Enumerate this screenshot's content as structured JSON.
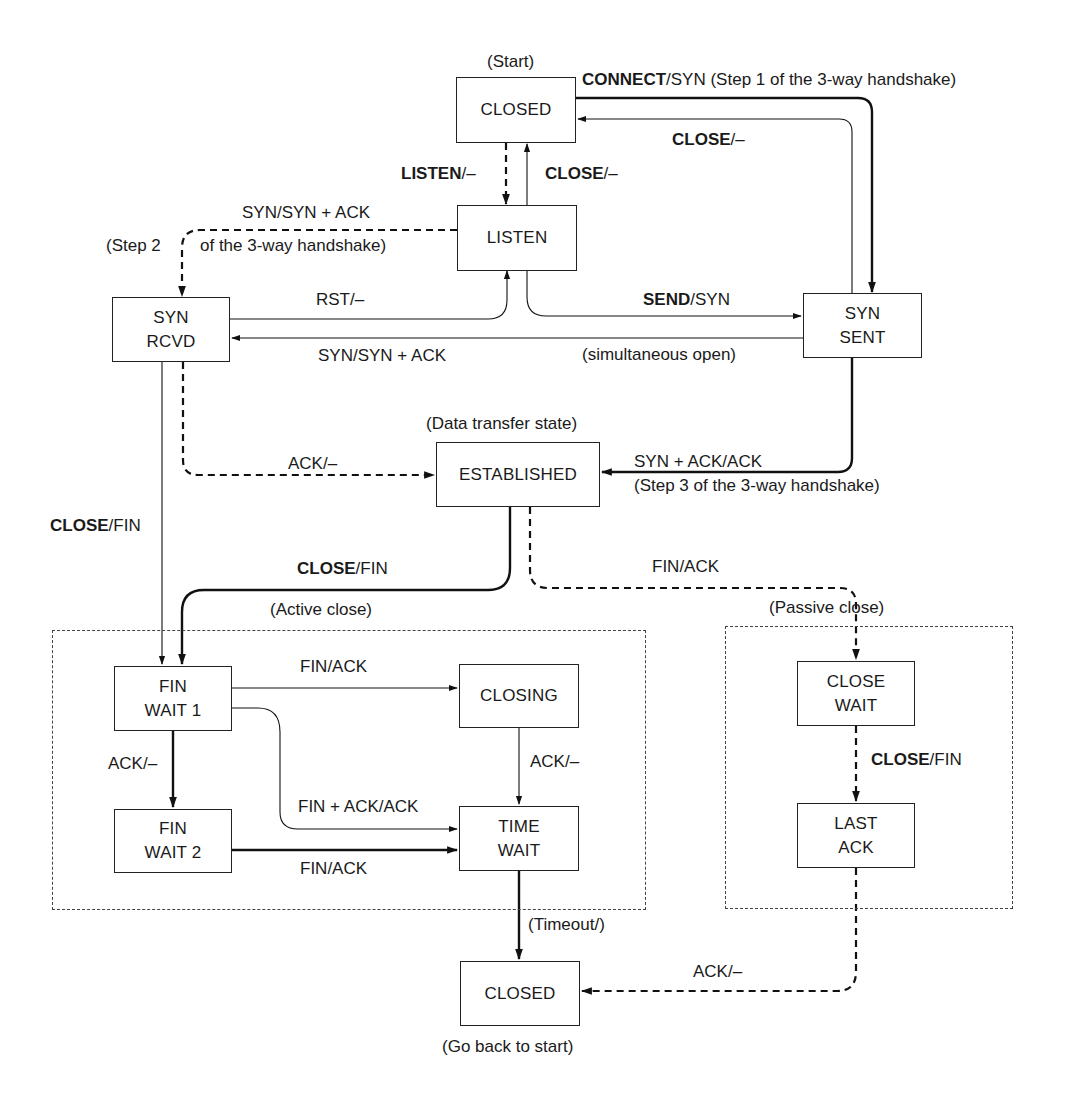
{
  "diagram": {
    "type": "state-machine",
    "states": {
      "closed_start": {
        "label": "CLOSED",
        "annotation": "(Start)"
      },
      "listen": {
        "label": "LISTEN"
      },
      "syn_rcvd": {
        "line1": "SYN",
        "line2": "RCVD"
      },
      "syn_sent": {
        "line1": "SYN",
        "line2": "SENT"
      },
      "established": {
        "label": "ESTABLISHED",
        "annotation": "(Data transfer state)"
      },
      "fin_wait_1": {
        "line1": "FIN",
        "line2": "WAIT 1"
      },
      "fin_wait_2": {
        "line1": "FIN",
        "line2": "WAIT 2"
      },
      "closing": {
        "label": "CLOSING"
      },
      "time_wait": {
        "line1": "TIME",
        "line2": "WAIT"
      },
      "close_wait": {
        "line1": "CLOSE",
        "line2": "WAIT"
      },
      "last_ack": {
        "line1": "LAST",
        "line2": "ACK"
      },
      "closed_end": {
        "label": "CLOSED",
        "annotation": "(Go back to start)"
      }
    },
    "groups": {
      "active_close": "(Active close)",
      "passive_close": "(Passive close)"
    },
    "transitions": {
      "connect": {
        "event": "CONNECT",
        "action": "/SYN (Step 1 of the 3-way handshake)",
        "from": "CLOSED",
        "to": "SYN SENT"
      },
      "syn_sent_close": {
        "event": "CLOSE",
        "action": "/–",
        "from": "SYN SENT",
        "to": "CLOSED"
      },
      "listen": {
        "event": "LISTEN",
        "action": "/–",
        "from": "CLOSED",
        "to": "LISTEN"
      },
      "listen_close": {
        "event": "CLOSE",
        "action": "/–",
        "from": "LISTEN",
        "to": "CLOSED"
      },
      "syn_synack": {
        "text": "SYN/SYN + ACK",
        "from": "LISTEN",
        "to": "SYN RCVD"
      },
      "step2_a": "(Step 2",
      "step2_b": "of the 3-way handshake)",
      "rst": {
        "text": "RST/–",
        "from": "SYN RCVD",
        "to": "LISTEN"
      },
      "send": {
        "event": "SEND",
        "action": "/SYN",
        "from": "LISTEN",
        "to": "SYN SENT"
      },
      "simul_open": {
        "text": "SYN/SYN + ACK",
        "note": "(simultaneous open)",
        "from": "SYN SENT",
        "to": "SYN RCVD"
      },
      "ack_est": {
        "text": "ACK/–",
        "from": "SYN RCVD",
        "to": "ESTABLISHED"
      },
      "synack_ack": {
        "text": "SYN + ACK/ACK",
        "note": "(Step 3 of the 3-way handshake)",
        "from": "SYN SENT",
        "to": "ESTABLISHED"
      },
      "rcvd_close": {
        "event": "CLOSE",
        "action": "/FIN",
        "from": "SYN RCVD",
        "to": "FIN WAIT 1"
      },
      "est_close": {
        "event": "CLOSE",
        "action": "/FIN",
        "from": "ESTABLISHED",
        "to": "FIN WAIT 1"
      },
      "fin_ack_passive": {
        "text": "FIN/ACK",
        "from": "ESTABLISHED",
        "to": "CLOSE WAIT"
      },
      "fw1_closing": {
        "text": "FIN/ACK",
        "from": "FIN WAIT 1",
        "to": "CLOSING"
      },
      "fw1_fw2": {
        "text": "ACK/–",
        "from": "FIN WAIT 1",
        "to": "FIN WAIT 2"
      },
      "fw1_tw": {
        "text": "FIN + ACK/ACK",
        "from": "FIN WAIT 1",
        "to": "TIME WAIT"
      },
      "closing_tw": {
        "text": "ACK/–",
        "from": "CLOSING",
        "to": "TIME WAIT"
      },
      "fw2_tw": {
        "text": "FIN/ACK",
        "from": "FIN WAIT 2",
        "to": "TIME WAIT"
      },
      "cw_la": {
        "event": "CLOSE",
        "action": "/FIN",
        "from": "CLOSE WAIT",
        "to": "LAST ACK"
      },
      "timeout": {
        "text": "(Timeout/)",
        "from": "TIME WAIT",
        "to": "CLOSED"
      },
      "la_closed": {
        "text": "ACK/–",
        "from": "LAST ACK",
        "to": "CLOSED"
      }
    },
    "legend": {
      "thick_solid": "client path",
      "dashed": "server path",
      "thin_solid": "unusual events"
    }
  }
}
